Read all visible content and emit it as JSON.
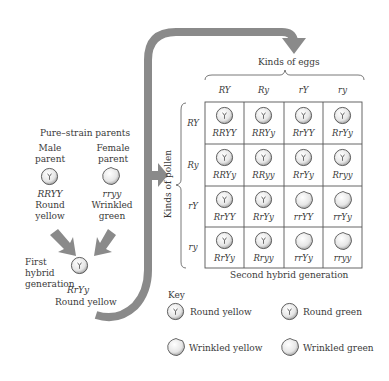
{
  "parents": {
    "heading": "Pure–strain parents",
    "male": {
      "title_line1": "Male",
      "title_line2": "parent",
      "genotype": "RRYY",
      "phenotype_line1": "Round",
      "phenotype_line2": "yellow",
      "pea": "round"
    },
    "female": {
      "title_line1": "Female",
      "title_line2": "parent",
      "genotype": "rryy",
      "phenotype_line1": "Wrinkled",
      "phenotype_line2": "green",
      "pea": "wrinkled"
    }
  },
  "first_gen": {
    "label_line1": "First",
    "label_line2": "hybrid",
    "label_line3": "generation",
    "genotype": "RrYy",
    "phenotype": "Round yellow"
  },
  "punnett": {
    "eggs_label": "Kinds of eggs",
    "pollen_label": "Kinds of pollen",
    "columns": [
      "RY",
      "Ry",
      "rY",
      "ry"
    ],
    "rows": [
      "RY",
      "Ry",
      "rY",
      "ry"
    ],
    "cells": [
      [
        {
          "g": "RRYY",
          "p": "round-yellow"
        },
        {
          "g": "RRYy",
          "p": "round-yellow"
        },
        {
          "g": "RrYY",
          "p": "round-yellow"
        },
        {
          "g": "RrYy",
          "p": "round-yellow"
        }
      ],
      [
        {
          "g": "RRYy",
          "p": "round-yellow"
        },
        {
          "g": "RRyy",
          "p": "round-green"
        },
        {
          "g": "RrYy",
          "p": "round-yellow"
        },
        {
          "g": "Rryy",
          "p": "round-green"
        }
      ],
      [
        {
          "g": "RrYY",
          "p": "round-yellow"
        },
        {
          "g": "RrYy",
          "p": "round-yellow"
        },
        {
          "g": "rrYY",
          "p": "wrinkled-yellow"
        },
        {
          "g": "rrYy",
          "p": "wrinkled-yellow"
        }
      ],
      [
        {
          "g": "RrYy",
          "p": "round-yellow"
        },
        {
          "g": "Rryy",
          "p": "round-green"
        },
        {
          "g": "rrYy",
          "p": "wrinkled-yellow"
        },
        {
          "g": "rryy",
          "p": "wrinkled-green"
        }
      ]
    ],
    "caption": "Second hybrid generation"
  },
  "key": {
    "title": "Key",
    "items": [
      {
        "label": "Round yellow",
        "pea": "round-yellow"
      },
      {
        "label": "Round green",
        "pea": "round-green"
      },
      {
        "label": "Wrinkled yellow",
        "pea": "wrinkled-yellow"
      },
      {
        "label": "Wrinkled green",
        "pea": "wrinkled-green"
      }
    ]
  },
  "colors": {
    "arrow": "#8a8a8a",
    "line": "#555555",
    "text": "#3a3a3a"
  }
}
